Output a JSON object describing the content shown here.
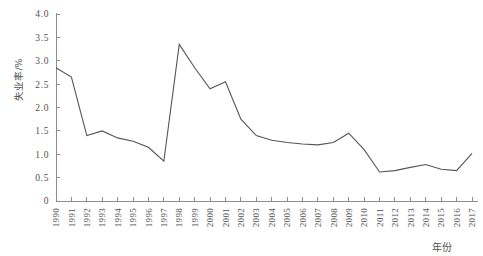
{
  "chart_data": {
    "type": "line",
    "title": "",
    "xlabel": "年份",
    "ylabel": "失业率/%",
    "xlim": [
      1990,
      2017
    ],
    "ylim": [
      0,
      4.0
    ],
    "grid": false,
    "legend": null,
    "x": [
      1990,
      1991,
      1992,
      1993,
      1994,
      1995,
      1996,
      1997,
      1998,
      1999,
      2000,
      2001,
      2002,
      2003,
      2004,
      2005,
      2006,
      2007,
      2008,
      2009,
      2010,
      2011,
      2012,
      2013,
      2014,
      2015,
      2016,
      2017
    ],
    "xtick_labels": [
      "1990",
      "1991",
      "1992",
      "1993",
      "1994",
      "1995",
      "1996",
      "1997",
      "1998",
      "1999",
      "2000",
      "2001",
      "2002",
      "2003",
      "2004",
      "2005",
      "2006",
      "2007",
      "2008",
      "2009",
      "2010",
      "2011",
      "2012",
      "2013",
      "2014",
      "2015",
      "2016",
      "2017"
    ],
    "ytick_labels": [
      "0",
      "0.5",
      "1.0",
      "1.5",
      "2.0",
      "2.5",
      "3.0",
      "3.5",
      "4.0"
    ],
    "ytick_values": [
      0,
      0.5,
      1.0,
      1.5,
      2.0,
      2.5,
      3.0,
      3.5,
      4.0
    ],
    "series": [
      {
        "name": "失业率",
        "color": "#555555",
        "values": [
          2.85,
          2.65,
          1.4,
          1.5,
          1.35,
          1.28,
          1.15,
          0.85,
          3.35,
          2.85,
          2.4,
          2.55,
          1.75,
          1.4,
          1.3,
          1.25,
          1.22,
          1.2,
          1.25,
          1.45,
          1.1,
          0.62,
          0.65,
          0.72,
          0.78,
          0.68,
          0.65,
          1.02
        ]
      }
    ]
  },
  "axes": {
    "y_axis_title": "失业率/%",
    "x_axis_title": "年份"
  },
  "colors": {
    "line": "#555555",
    "axis": "#8d8d8d",
    "text": "#4f4f4f",
    "background": "#ffffff"
  }
}
